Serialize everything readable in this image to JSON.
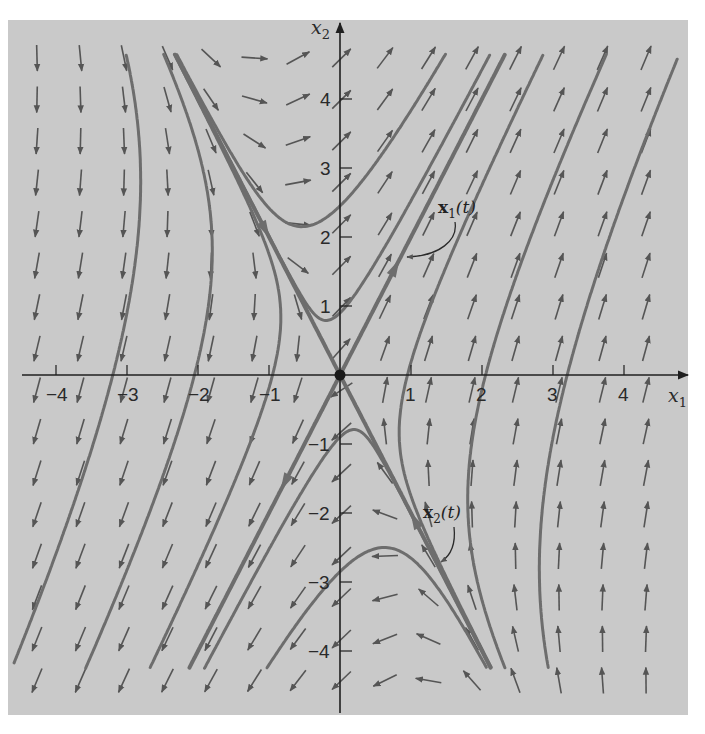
{
  "chart_data": {
    "type": "phase-portrait",
    "title": "",
    "system": "x' = [[1, 1], [4, 1]] x",
    "eigen": [
      {
        "value": 3,
        "vector": [
          1,
          2
        ],
        "label": "x1(t)",
        "direction": "outward"
      },
      {
        "value": -1,
        "vector": [
          1,
          -2
        ],
        "label": "x2(t)",
        "direction": "inward"
      }
    ],
    "xlabel": "x1",
    "ylabel": "x2",
    "xlim": [
      -4.68,
      4.9
    ],
    "ylim": [
      -4.9,
      5.1
    ],
    "x_ticks": [
      -4,
      -3,
      -2,
      -1,
      1,
      2,
      3,
      4
    ],
    "y_ticks": [
      -4,
      -3,
      -2,
      -1,
      1,
      2,
      3,
      4
    ],
    "critical_point": [
      0,
      0
    ],
    "critical_point_type": "saddle",
    "trajectory_seeds": [
      [
        0,
        2.45
      ],
      [
        0,
        0.9
      ],
      [
        0,
        -0.9
      ],
      [
        0,
        -2.85
      ],
      [
        -3.2,
        0
      ],
      [
        -2.05,
        0
      ],
      [
        -0.95,
        0
      ],
      [
        3.2,
        0
      ],
      [
        2.05,
        0
      ],
      [
        0.95,
        0
      ]
    ],
    "trajectory_clip_x2": [
      -4.25,
      4.65
    ],
    "labels": {
      "x1t": {
        "main": "x",
        "sub": "1",
        "arg": "(t)"
      },
      "x2t": {
        "main": "x",
        "sub": "2",
        "arg": "(t)"
      }
    },
    "grid": false,
    "legend": "none"
  },
  "axes": {
    "x_label": "x",
    "x_label_sub": "1",
    "y_label": "x",
    "y_label_sub": "2"
  },
  "colors": {
    "background": "#c9c9c9",
    "trajectory": "#6d6d6d",
    "arrow": "#555555",
    "axis": "#1f1f1f"
  }
}
